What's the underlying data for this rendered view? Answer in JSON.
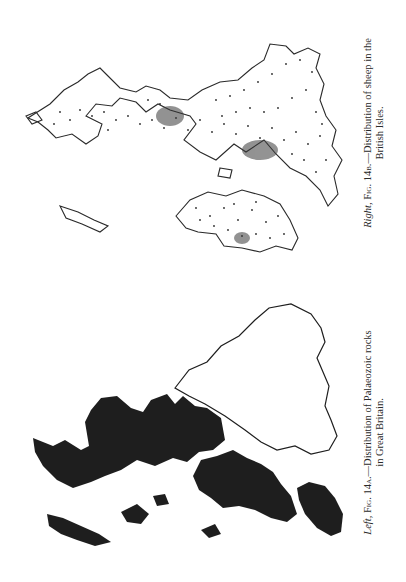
{
  "figures": [
    {
      "id": "fig14b",
      "position_word": "Right,",
      "fig_label": "Fig. 14b.",
      "caption_line1": "—Distribution of sheep in the",
      "caption_line2": "British Isles.",
      "style": "dot-distribution",
      "ink_color": "#2a2a2a"
    },
    {
      "id": "fig14a",
      "position_word": "Left,",
      "fig_label": "Fig. 14a.",
      "caption_line1": "—Distribution of Palaeozoic rocks",
      "caption_line2": "in Great Britain.",
      "style": "solid-shaded",
      "ink_color": "#1e1e1e"
    }
  ]
}
